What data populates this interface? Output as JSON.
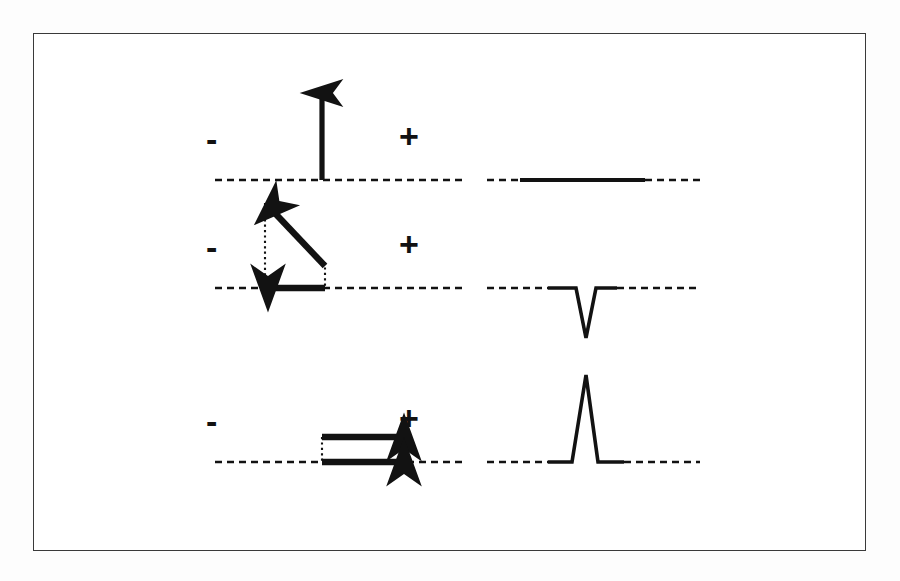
{
  "figure": {
    "title": "ECG vector direction and resulting deflection",
    "background_color": "#fdfdfd",
    "frame_color": "#3a3a3a",
    "ink_color": "#121212",
    "rows": [
      {
        "id": "row-perpendicular",
        "left_panel": {
          "negative_label": "-",
          "positive_label": "+",
          "baseline_y": 180,
          "vectors": [
            {
              "name": "perpendicular-vector-arrow",
              "direction": "up",
              "x1": 322,
              "y1": 180,
              "x2": 322,
              "y2": 87
            }
          ],
          "construction_lines": []
        },
        "right_panel": {
          "name": "isoelectric-trace",
          "deflection": "isoelectric",
          "baseline_y": 180,
          "amplitude": 0,
          "peak_y": 180
        }
      },
      {
        "id": "row-negative",
        "left_panel": {
          "negative_label": "-",
          "positive_label": "+",
          "baseline_y": 288,
          "vectors": [
            {
              "name": "oblique-vector-arrow",
              "direction": "up-left",
              "x1": 325,
              "y1": 266,
              "x2": 265,
              "y2": 203
            },
            {
              "name": "horizontal-component-arrow",
              "direction": "left",
              "x1": 325,
              "y1": 288,
              "x2": 262,
              "y2": 288
            }
          ],
          "construction_lines": [
            {
              "name": "dotted-vertical-left",
              "x1": 265,
              "y1": 203,
              "x2": 265,
              "y2": 288
            },
            {
              "name": "dotted-vertical-right",
              "x1": 325,
              "y1": 266,
              "x2": 325,
              "y2": 288
            }
          ]
        },
        "right_panel": {
          "name": "negative-deflection-trace",
          "deflection": "negative",
          "baseline_y": 288,
          "amplitude": -50,
          "peak_y": 338
        }
      },
      {
        "id": "row-positive",
        "left_panel": {
          "negative_label": "-",
          "positive_label": "+",
          "baseline_y": 462,
          "vectors": [
            {
              "name": "upper-vector-arrow",
              "direction": "right",
              "x1": 322,
              "y1": 437,
              "x2": 410,
              "y2": 437
            },
            {
              "name": "baseline-vector-arrow",
              "direction": "right",
              "x1": 322,
              "y1": 462,
              "x2": 410,
              "y2": 462
            }
          ],
          "construction_lines": [
            {
              "name": "dotted-vertical-left",
              "x1": 322,
              "y1": 437,
              "x2": 322,
              "y2": 462
            },
            {
              "name": "dotted-vertical-right",
              "x1": 408,
              "y1": 437,
              "x2": 408,
              "y2": 462
            }
          ]
        },
        "right_panel": {
          "name": "positive-deflection-trace",
          "deflection": "positive",
          "baseline_y": 462,
          "amplitude": 87,
          "peak_y": 375
        }
      }
    ],
    "label_positions": [
      {
        "minus_x": 211,
        "minus_y": 137,
        "plus_x": 403,
        "plus_y": 135
      },
      {
        "minus_x": 211,
        "minus_y": 245,
        "plus_x": 403,
        "plus_y": 243
      },
      {
        "minus_x": 211,
        "minus_y": 419,
        "plus_x": 403,
        "plus_y": 417
      }
    ],
    "baseline_extents": {
      "left_panel_x_start": 215,
      "left_panel_x_end": 465,
      "right_panel_x_start": 487,
      "right_panel_x_end": 700,
      "trace_solid_x_start": 520,
      "trace_solid_x_end": 645
    }
  }
}
